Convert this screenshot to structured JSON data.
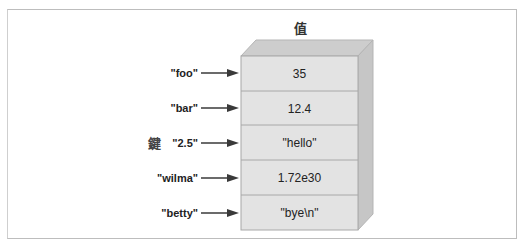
{
  "diagram": {
    "title": "值",
    "keys_label": "鍵",
    "rows": [
      {
        "key": "\"foo\"",
        "value": "35"
      },
      {
        "key": "\"bar\"",
        "value": "12.4"
      },
      {
        "key": "\"2.5\"",
        "value": "\"hello\""
      },
      {
        "key": "\"wilma\"",
        "value": "1.72e30"
      },
      {
        "key": "\"betty\"",
        "value": "\"bye\\n\""
      }
    ],
    "colors": {
      "front_face": "#e2e2e2",
      "top_face": "#cdcdcd",
      "right_face": "#c4c4c4",
      "cell_border": "#a8a8a8",
      "arrow": "#3a3a3a"
    }
  }
}
